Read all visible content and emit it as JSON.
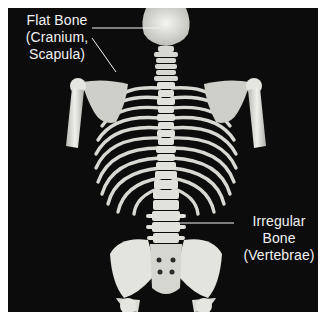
{
  "figure": {
    "background_color": "#0c0c0c",
    "bone_color": "#e6e6e2",
    "label_color": "#f2f2f2"
  },
  "labels": {
    "flat_bone": {
      "line1": "Flat Bone",
      "line2": "(Cranium,",
      "line3": "Scapula)"
    },
    "irregular_bone": {
      "line1": "Irregular",
      "line2": "Bone",
      "line3": "(Vertebrae)"
    }
  }
}
